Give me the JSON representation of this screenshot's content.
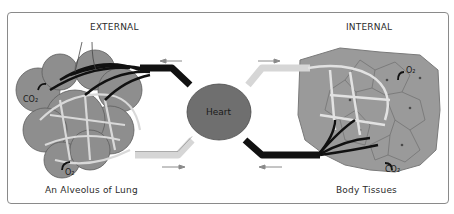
{
  "labels": {
    "external": "EXTERNAL",
    "internal": "INTERNAL",
    "lung": "An Alveolus of Lung",
    "tissues": "Body Tissues",
    "heart": "Heart"
  },
  "chemicals": {
    "lung_co2": "CO₂",
    "lung_o2": "O₂",
    "tissue_o2": "O₂",
    "tissue_co2": "CO₂"
  },
  "colors": {
    "heart": "#6f6f6f",
    "alveoli": "#8e8e8e",
    "tissue": "#9a9a9a",
    "oxygenated_vessel": "#d6d6d6",
    "deoxygenated_vessel": "#111111",
    "frame": "#8a8a8a"
  }
}
